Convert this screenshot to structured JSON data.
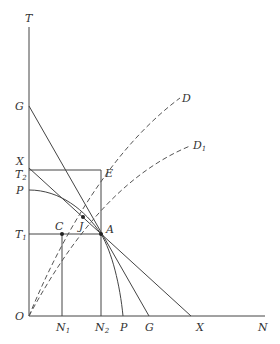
{
  "diagram": {
    "axes": {
      "y_label": "T",
      "x_label": "N",
      "origin_label": "O"
    },
    "y_axis_points": [
      {
        "id": "G",
        "label": "G"
      },
      {
        "id": "X",
        "label": "X"
      },
      {
        "id": "T2",
        "label": "T",
        "sub": "2"
      },
      {
        "id": "P",
        "label": "P"
      },
      {
        "id": "T1",
        "label": "T",
        "sub": "1"
      }
    ],
    "x_axis_points": [
      {
        "id": "N1",
        "label": "N",
        "sub": "1"
      },
      {
        "id": "N2",
        "label": "N",
        "sub": "2"
      },
      {
        "id": "P",
        "label": "P"
      },
      {
        "id": "G",
        "label": "G"
      },
      {
        "id": "X",
        "label": "X"
      }
    ],
    "points": {
      "E": "E",
      "C": "C",
      "J": "J",
      "A": "A"
    },
    "curves": {
      "D": "D",
      "D1": {
        "label": "D",
        "sub": "1"
      }
    }
  }
}
